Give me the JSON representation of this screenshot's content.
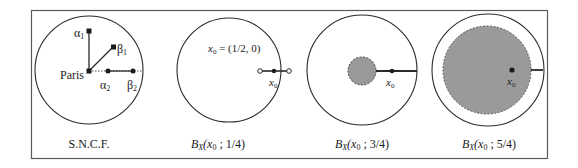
{
  "figure": {
    "panels": [
      {
        "id": "sncf",
        "caption": "S.N.C.F.",
        "labels": {
          "paris": "Paris",
          "alpha1": "α",
          "alpha1_sub": "1",
          "beta1": "β",
          "beta1_sub": "1",
          "alpha2": "α",
          "alpha2_sub": "2",
          "beta2": "β",
          "beta2_sub": "2"
        }
      },
      {
        "id": "ball-1-4",
        "caption_B": "B",
        "caption_sub": "X",
        "caption_rest": "(x",
        "caption_x_sub": "0",
        "caption_tail": " ; 1/4)",
        "note_x": "x",
        "note_sub": "0",
        "note_rest": " = (1/2, 0)",
        "point_label": "x",
        "point_sub": "0"
      },
      {
        "id": "ball-3-4",
        "caption_B": "B",
        "caption_sub": "X",
        "caption_rest": "(x",
        "caption_x_sub": "0",
        "caption_tail": " ; 3/4)",
        "point_label": "x",
        "point_sub": "0"
      },
      {
        "id": "ball-5-4",
        "caption_B": "B",
        "caption_sub": "X",
        "caption_rest": "(x",
        "caption_x_sub": "0",
        "caption_tail": " ; 5/4)",
        "point_label": "x",
        "point_sub": "0"
      }
    ],
    "colors": {
      "stroke": "#2a2a2a",
      "frame": "#555555",
      "fill_gray": "#9a9a9a"
    }
  }
}
